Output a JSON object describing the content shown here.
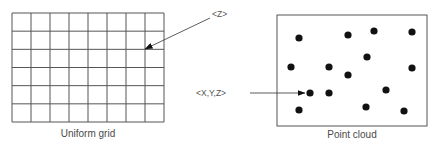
{
  "panels": {
    "uniform_grid": {
      "caption": "Uniform grid",
      "columns": 8,
      "rows": 6,
      "frame": {
        "x": 12,
        "y": 13,
        "width": 152,
        "height": 109
      },
      "annotation": {
        "label": "<Z>",
        "label_pos": {
          "x": 212,
          "y": 17
        },
        "arrow_from": {
          "x": 210,
          "y": 18
        },
        "arrow_to": {
          "x": 145,
          "y": 49
        }
      },
      "caption_pos": {
        "x": 88,
        "y": 137
      }
    },
    "point_cloud": {
      "caption": "Point cloud",
      "frame": {
        "x": 277,
        "y": 15,
        "width": 150,
        "height": 111
      },
      "points": [
        {
          "x": 299,
          "y": 38
        },
        {
          "x": 348,
          "y": 35
        },
        {
          "x": 374,
          "y": 31
        },
        {
          "x": 412,
          "y": 32
        },
        {
          "x": 367,
          "y": 57
        },
        {
          "x": 291,
          "y": 67
        },
        {
          "x": 329,
          "y": 67
        },
        {
          "x": 348,
          "y": 75
        },
        {
          "x": 412,
          "y": 68
        },
        {
          "x": 310,
          "y": 93
        },
        {
          "x": 329,
          "y": 93
        },
        {
          "x": 386,
          "y": 90
        },
        {
          "x": 299,
          "y": 110
        },
        {
          "x": 366,
          "y": 107
        },
        {
          "x": 404,
          "y": 111
        }
      ],
      "point_radius": 3.6,
      "annotation": {
        "label": "<X,Y,Z>",
        "label_pos": {
          "x": 196,
          "y": 96
        },
        "arrow_from": {
          "x": 250,
          "y": 93
        },
        "arrow_to": {
          "x": 305,
          "y": 93
        }
      },
      "caption_pos": {
        "x": 352,
        "y": 138
      }
    }
  },
  "colors": {
    "line": "#555555",
    "point": "#111111",
    "arrow": "#333333",
    "text": "#4a4a4a"
  }
}
